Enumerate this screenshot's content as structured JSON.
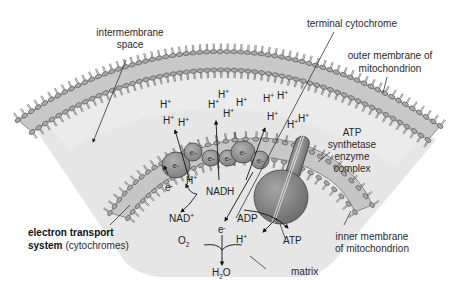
{
  "figure": {
    "colors": {
      "background": "#ffffff",
      "matrix_fill": "#e4e4e4",
      "membrane_band": "#c6c6c6",
      "lipid_head": "#a9a9a9",
      "lipid_stroke": "#3a3a3a",
      "carrier_fill": "#8f8f8f",
      "atp_synthase_fill": "#7c7c7c",
      "text": "#2a2a2a"
    }
  },
  "labels": {
    "intermembrane_space": [
      "intermembrane",
      "space"
    ],
    "terminal_cytochrome": "terminal cytochrome",
    "outer_membrane": [
      "outer membrane of",
      "mitochondrion"
    ],
    "atp_synthetase": [
      "ATP",
      "synthetase",
      "enzyme",
      "complex"
    ],
    "inner_membrane": [
      "inner membrane",
      "of mitochondrion"
    ],
    "matrix": "matrix",
    "ets_bold": "electron transport",
    "ets_bold_2": "system",
    "ets_normal": "(cytochromes)"
  },
  "chemistry": {
    "proton": {
      "base": "H",
      "sup": "+"
    },
    "electron": {
      "base": "e",
      "sup": "-"
    },
    "nadh": "NADH",
    "nad_plus": {
      "base": "NAD",
      "sup": "+"
    },
    "oxygen": {
      "base": "O",
      "sub": "2"
    },
    "water": {
      "pre": "H",
      "sub": "2",
      "post": "O"
    },
    "adp": "ADP",
    "atp": "ATP"
  },
  "protons_intermembrane": [
    {
      "x": 163,
      "y": 124
    },
    {
      "x": 160,
      "y": 108
    },
    {
      "x": 178,
      "y": 126
    },
    {
      "x": 208,
      "y": 108
    },
    {
      "x": 218,
      "y": 98
    },
    {
      "x": 223,
      "y": 117
    },
    {
      "x": 236,
      "y": 106
    },
    {
      "x": 263,
      "y": 102
    },
    {
      "x": 277,
      "y": 99
    },
    {
      "x": 267,
      "y": 120
    },
    {
      "x": 287,
      "y": 128
    },
    {
      "x": 298,
      "y": 122
    }
  ],
  "carriers": [
    {
      "x": 176,
      "y": 165,
      "rx": 14,
      "ry": 13,
      "label": "e-"
    },
    {
      "x": 193,
      "y": 152,
      "rx": 9,
      "ry": 9,
      "label": "e-"
    },
    {
      "x": 211,
      "y": 158,
      "rx": 9,
      "ry": 8,
      "label": "e-"
    },
    {
      "x": 228,
      "y": 158,
      "rx": 9,
      "ry": 8,
      "label": "e-"
    },
    {
      "x": 243,
      "y": 152,
      "rx": 12,
      "ry": 11,
      "label": "e-"
    },
    {
      "x": 260,
      "y": 160,
      "rx": 9,
      "ry": 9,
      "label": "e-"
    }
  ],
  "matrix_protons": [
    {
      "x": 184,
      "y": 181
    }
  ],
  "matrix_electrons": [
    {
      "x": 170,
      "y": 188
    },
    {
      "x": 223,
      "y": 230
    }
  ]
}
